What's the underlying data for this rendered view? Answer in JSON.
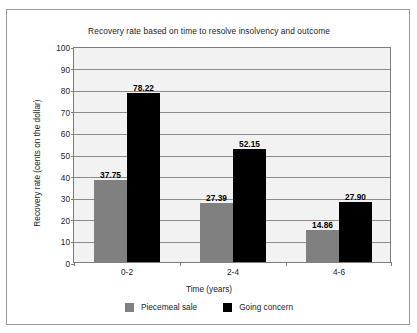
{
  "chart_data": {
    "type": "bar",
    "title": "Recovery rate based on time to resolve insolvency and outcome",
    "xlabel": "Time (years)",
    "ylabel": "Recovery rate (cents on the dollar)",
    "categories": [
      "0-2",
      "2-4",
      "4-6"
    ],
    "series": [
      {
        "name": "Piecemeal sale",
        "color": "#808080",
        "values": [
          37.75,
          27.39,
          14.86
        ],
        "labels": [
          "37.75",
          "27.39",
          "14.86"
        ]
      },
      {
        "name": "Going concern",
        "color": "#000000",
        "values": [
          78.22,
          52.15,
          27.9
        ],
        "labels": [
          "78.22",
          "52.15",
          "27.90"
        ]
      }
    ],
    "ylim": [
      0,
      100
    ],
    "ytick_step": 10,
    "yticks": [
      "100",
      "90",
      "80",
      "70",
      "60",
      "50",
      "40",
      "30",
      "20",
      "10",
      "0"
    ],
    "grid": true,
    "legend_position": "bottom"
  },
  "style": {
    "plot_background": "#f2f2f2",
    "frame_background": "#ffffff",
    "gridline_color": "#8c8c8c",
    "axis_color": "#7d7d7d",
    "text_color": "#1c1c1c"
  }
}
